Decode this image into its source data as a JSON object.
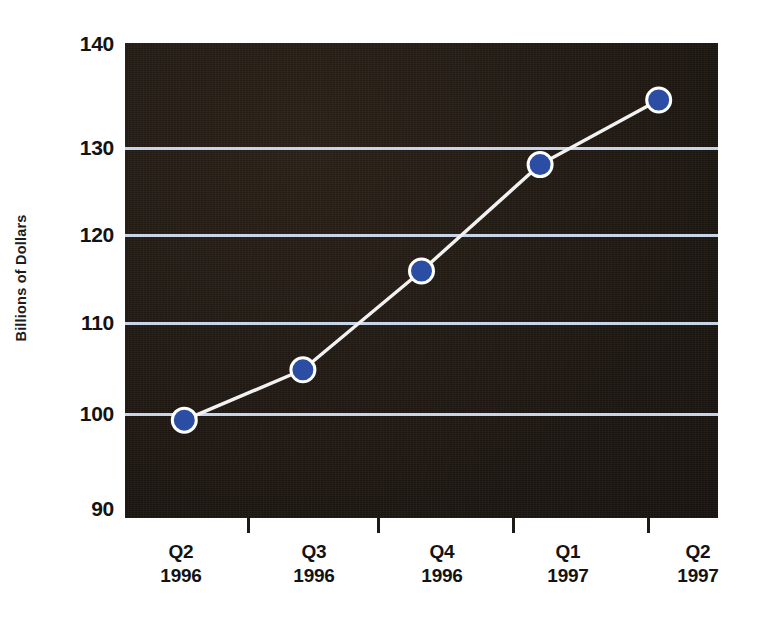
{
  "chart_data": {
    "type": "line",
    "title": "",
    "xlabel": "",
    "ylabel": "Billions of Dollars",
    "ylim": [
      90,
      140
    ],
    "ytick_step": 10,
    "yticks": [
      140,
      130,
      120,
      110,
      100,
      90
    ],
    "gridlines": [
      130,
      120,
      110,
      100
    ],
    "grid": true,
    "legend_position": "none",
    "categories": [
      "Q2 1996",
      "Q3 1996",
      "Q4 1996",
      "Q1 1997",
      "Q2 1997"
    ],
    "category_labels": [
      {
        "quarter": "Q2",
        "year": "1996"
      },
      {
        "quarter": "Q3",
        "year": "1996"
      },
      {
        "quarter": "Q4",
        "year": "1996"
      },
      {
        "quarter": "Q1",
        "year": "1997"
      },
      {
        "quarter": "Q2",
        "year": "1997"
      }
    ],
    "series": [
      {
        "name": "Billions of Dollars",
        "values": [
          100.3,
          105.6,
          116.0,
          127.2,
          134.0
        ]
      }
    ],
    "colors": {
      "plot_background": "#211a14",
      "gridline": "#c8d4e8",
      "line": "#f2f2f2",
      "marker_fill": "#2b4da4",
      "marker_edge": "#ffffff",
      "tick_label": "#131313",
      "axis_title": "#1c1c1c",
      "page_background": "#ffffff"
    }
  },
  "axis": {
    "y_title": "Billions of Dollars",
    "y_tick_labels": [
      "140",
      "130",
      "120",
      "110",
      "100",
      "90"
    ]
  },
  "header": {
    "title_fragment": ""
  }
}
